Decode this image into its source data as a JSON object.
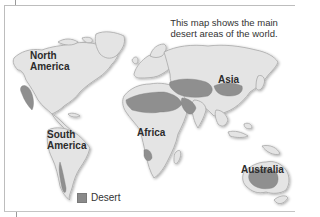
{
  "map": {
    "caption": "This map shows the main desert areas of the world.",
    "labels": {
      "north_america": "North\nAmerica",
      "north_america_line1": "North",
      "north_america_line2": "America",
      "south_america_line1": "South",
      "south_america_line2": "America",
      "africa": "Africa",
      "asia": "Asia",
      "australia": "Australia"
    },
    "legend": {
      "items": [
        {
          "label": "Desert",
          "color": "#8a8a8a"
        }
      ]
    },
    "colors": {
      "land": "#e4e4e4",
      "coast": "#a8a8a8",
      "desert": "#8f8f8f",
      "background": "#ffffff"
    }
  }
}
